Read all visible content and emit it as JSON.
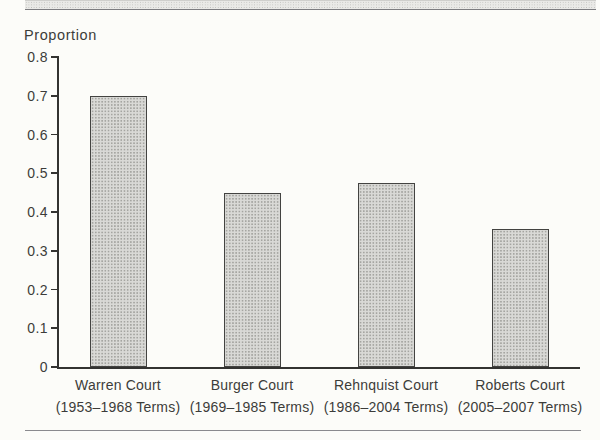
{
  "page": {
    "background": "#fcfcf9",
    "rule_color": "#8a8a8e",
    "band_fill": "#eaeae7"
  },
  "chart_data": {
    "type": "bar",
    "title": "",
    "ylabel": "Proportion",
    "xlabel": "",
    "categories": [
      "Warren Court",
      "Burger Court",
      "Rehnquist Court",
      "Roberts Court"
    ],
    "category_sublabels": [
      "(1953–1968 Terms)",
      "(1969–1985 Terms)",
      "(1986–2004 Terms)",
      "(2005–2007 Terms)"
    ],
    "values": [
      0.7,
      0.45,
      0.475,
      0.355
    ],
    "ylim": [
      0,
      0.8
    ],
    "ytick_step": 0.1,
    "ytick_labels": [
      "0",
      "0.1",
      "0.2",
      "0.3",
      "0.4",
      "0.5",
      "0.6",
      "0.7",
      "0.8"
    ],
    "grid": false,
    "legend": false,
    "bar_fill": "#d9d9d6",
    "bar_dot_color": "#a5a5a1",
    "bar_border_color": "#434341",
    "axis_color": "#333331",
    "text_color": "#3c3c3a"
  }
}
